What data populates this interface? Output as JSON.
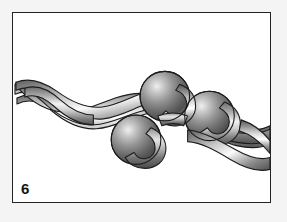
{
  "figure": {
    "number": "6",
    "caption": "",
    "alt_description": "Grayscale three-dimensional rendering of a braided ribbon strand with three attached spheres",
    "background_color": "#ffffff",
    "outer_background_color": "#f4f4f4",
    "border_color": "#232323",
    "border_width_px": 1.5
  },
  "illustration": {
    "type": "braid-with-spheres",
    "strand_count": 3,
    "ribbon_colors": {
      "highlight": "#ffffff",
      "light": "#e2e2e2",
      "mid": "#a8a8a8",
      "dark": "#6a6a6a",
      "shadow": "#4a4a4a",
      "outline": "#1c1c1c"
    },
    "spheres": [
      {
        "label": "sphere-top-center",
        "cx": 153,
        "cy": 84,
        "r": 25
      },
      {
        "label": "sphere-bottom-left",
        "cx": 124,
        "cy": 128,
        "r": 25
      },
      {
        "label": "sphere-right",
        "cx": 198,
        "cy": 104,
        "r": 25
      }
    ],
    "sphere_colors": {
      "highlight": "#e8e8e8",
      "mid": "#909090",
      "dark": "#4d4d4d",
      "rim": "#6f6f6f",
      "outline": "#1c1c1c"
    },
    "braid_axis_start": {
      "x": 2,
      "y": 72
    },
    "braid_axis_end": {
      "x": 262,
      "y": 128
    }
  }
}
